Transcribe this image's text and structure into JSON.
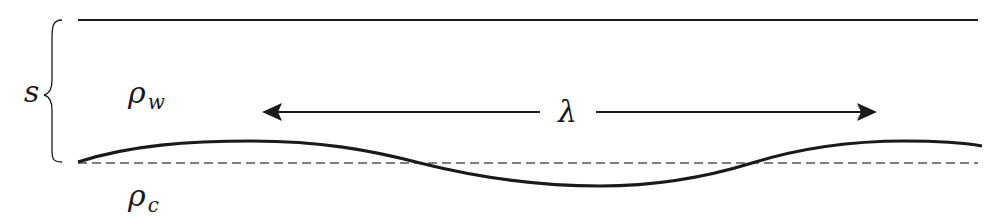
{
  "diagram": {
    "labels": {
      "thickness": "s",
      "rho_upper": "ρ",
      "rho_upper_sub": "w",
      "rho_lower": "ρ",
      "rho_lower_sub": "c",
      "wavelength": "λ"
    },
    "elements": {
      "top_surface": "solid horizontal line (upper boundary)",
      "interface": "sinusoidal perturbed interface",
      "reference_level": "dashed horizontal line (unperturbed interface)",
      "wavelength_arrow": "double-headed arrow spanning one wavelength",
      "thickness_brace": "curly brace indicating layer thickness"
    },
    "colors": {
      "stroke": "#1a1a1a",
      "dashed": "#555555",
      "background": "#ffffff"
    }
  }
}
